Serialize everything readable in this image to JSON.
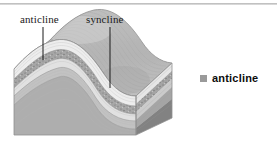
{
  "figure": {
    "type": "geological-block-diagram",
    "background_color": "#ffffff",
    "rule_color": "#c3c3c3"
  },
  "annotations": [
    {
      "id": "anticline",
      "label": "anticline",
      "leader": {
        "x": 43,
        "y_top": 27,
        "y_bottom": 60
      }
    },
    {
      "id": "syncline",
      "label": "syncline",
      "leader": {
        "x": 110,
        "y_top": 27,
        "y_bottom": 88
      }
    }
  ],
  "legend": {
    "items": [
      {
        "label": "anticline",
        "swatch_color": "#9a9a9a"
      }
    ]
  },
  "strata": {
    "top_surface_color": "#c0c0c0",
    "layers": [
      {
        "name": "surface-layer",
        "color": "#cfcfcf"
      },
      {
        "name": "light-band",
        "color": "#efefef"
      },
      {
        "name": "conglomerate-band",
        "color": "#a8a8a8"
      },
      {
        "name": "pale-band",
        "color": "#e4e4e4"
      },
      {
        "name": "mid-gray-band",
        "color": "#c6c6c6"
      },
      {
        "name": "lower-gray-band",
        "color": "#b0b0b0"
      },
      {
        "name": "basal-band",
        "color": "#d2d2d2"
      }
    ],
    "side_face_layers": [
      {
        "name": "side-top",
        "color": "#d8d8d8"
      },
      {
        "name": "side-light",
        "color": "#e9e9e9"
      },
      {
        "name": "side-speckle",
        "color": "#9e9e9e"
      },
      {
        "name": "side-pale",
        "color": "#cfcfcf"
      },
      {
        "name": "side-mid",
        "color": "#aeaeae"
      },
      {
        "name": "side-dark",
        "color": "#8c8c8c"
      },
      {
        "name": "side-base",
        "color": "#7d7d7d"
      }
    ]
  }
}
